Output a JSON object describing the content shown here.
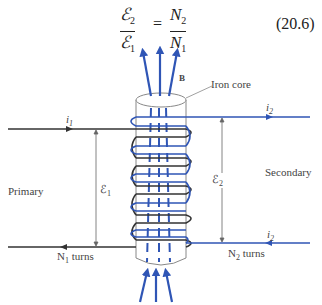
{
  "equation": {
    "lhs_numerator": "ℰ",
    "lhs_numerator_sub": "2",
    "lhs_denominator": "ℰ",
    "lhs_denominator_sub": "1",
    "equals": "=",
    "rhs_numerator": "N",
    "rhs_numerator_sub": "2",
    "rhs_denominator": "N",
    "rhs_denominator_sub": "1",
    "number": "(20.6)"
  },
  "labels": {
    "field": "B",
    "core": "Iron core",
    "i1": "i",
    "i1_sub": "1",
    "i2_top": "i",
    "i2_top_sub": "2",
    "i2_bottom": "i",
    "i2_bottom_sub": "2",
    "primary": "Primary",
    "secondary": "Secondary",
    "emf1": "ℰ",
    "emf1_sub": "1",
    "emf2": "ℰ",
    "emf2_sub": "2",
    "n1_turns": "N",
    "n1_sub": "1",
    "n1_suffix": " turns",
    "n2_turns": "N",
    "n2_sub": "2",
    "n2_suffix": " turns"
  },
  "colors": {
    "primary_wire": "#333333",
    "secondary_wire": "#2f55b5",
    "field_lines": "#2f55b5",
    "core_outline": "#777777"
  }
}
